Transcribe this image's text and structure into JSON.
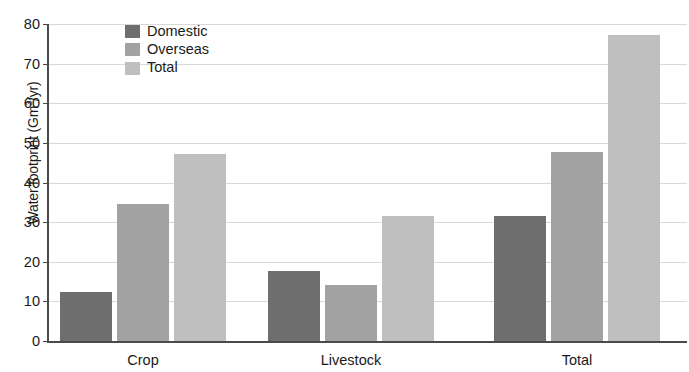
{
  "chart_data": {
    "type": "bar",
    "title": "",
    "xlabel": "",
    "ylabel": "Water footprint (Gm3/yr)",
    "ylabel_prefix": "Water footprint (Gm",
    "ylabel_sup": "3",
    "ylabel_suffix": "/yr)",
    "categories": [
      "Crop",
      "Livestock",
      "Total"
    ],
    "series": [
      {
        "name": "Domestic",
        "color": "#6e6e6e",
        "values": [
          12.3,
          17.6,
          31.5
        ]
      },
      {
        "name": "Overseas",
        "color": "#a2a2a2",
        "values": [
          34.7,
          14.1,
          47.6
        ]
      },
      {
        "name": "Total",
        "color": "#bfbfbf",
        "values": [
          47.3,
          31.5,
          77.3
        ]
      }
    ],
    "ylim": [
      0,
      80
    ],
    "yticks": [
      0,
      10,
      20,
      30,
      40,
      50,
      60,
      70,
      80
    ],
    "ytick_labels": [
      "0",
      "10",
      "20",
      "30",
      "40",
      "50",
      "60",
      "70",
      "80"
    ],
    "grid": true,
    "legend_position": "top-left-inside",
    "legend_entries": [
      "Domestic",
      "Overseas",
      "Total"
    ]
  }
}
